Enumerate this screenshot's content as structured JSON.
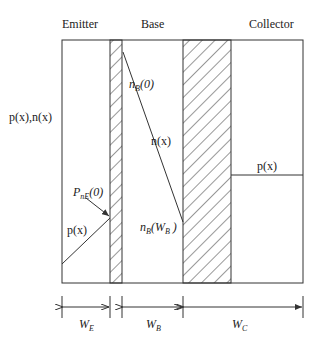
{
  "regions": {
    "emitter": "Emitter",
    "base": "Base",
    "collector": "Collector"
  },
  "axis_label": "p(x),n(x)",
  "curves": {
    "n_base": "n(x)",
    "p_emitter": "p(x)",
    "p_collector": "p(x)"
  },
  "annotations": {
    "nB0": {
      "main": "n",
      "sub": "B",
      "arg": "(0)"
    },
    "nBWB": {
      "main": "n",
      "sub": "B",
      "arg_open": "(W",
      "arg_sub": "B",
      "arg_close": " )"
    },
    "PnE0": {
      "main": "P",
      "sub": "nE",
      "arg": "(0)"
    }
  },
  "dimensions": {
    "WE": {
      "main": "W",
      "sub": "E"
    },
    "WB": {
      "main": "W",
      "sub": "B"
    },
    "WC": {
      "main": "W",
      "sub": "C"
    }
  },
  "colors": {
    "line": "#333333",
    "background": "#ffffff"
  }
}
